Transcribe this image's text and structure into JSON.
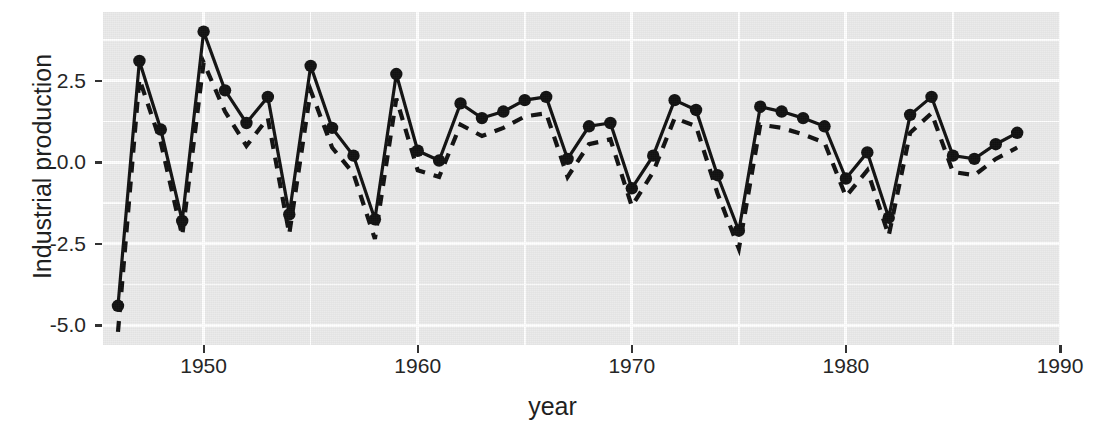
{
  "chart_data": {
    "type": "line",
    "title": "",
    "xlabel": "year",
    "ylabel": "Industrial production",
    "xlim": [
      1945.3,
      1990.0
    ],
    "ylim": [
      -5.6,
      4.6
    ],
    "xticks": [
      1950,
      1960,
      1970,
      1980,
      1990
    ],
    "xticklabels": [
      "1950",
      "1960",
      "1970",
      "1980",
      "1990"
    ],
    "yticks": [
      2.5,
      0.0,
      -2.5,
      -5.0
    ],
    "yticklabels": [
      "2.5",
      "0.0",
      "-2.5",
      "-5.0"
    ],
    "grid": true,
    "legend": "none",
    "panel_background": "#ebebeb",
    "grid_color": "#ffffff",
    "line_color": "#000000",
    "x": [
      1946,
      1947,
      1948,
      1949,
      1950,
      1951,
      1952,
      1953,
      1954,
      1955,
      1956,
      1957,
      1958,
      1959,
      1960,
      1961,
      1962,
      1963,
      1964,
      1965,
      1966,
      1967,
      1968,
      1969,
      1970,
      1971,
      1972,
      1973,
      1974,
      1975,
      1976,
      1977,
      1978,
      1979,
      1980,
      1981,
      1982,
      1983,
      1984,
      1985,
      1986,
      1987,
      1988
    ],
    "series": [
      {
        "name": "observed",
        "style": "solid-with-points",
        "marker": "filled-circle",
        "values": [
          -4.4,
          3.1,
          1.0,
          -1.8,
          4.0,
          2.2,
          1.2,
          2.0,
          -1.6,
          2.95,
          1.05,
          0.2,
          -1.75,
          2.7,
          0.35,
          0.05,
          1.8,
          1.35,
          1.55,
          1.9,
          2.0,
          0.1,
          1.1,
          1.2,
          -0.8,
          0.2,
          1.9,
          1.6,
          -0.4,
          -2.1,
          1.7,
          1.55,
          1.35,
          1.1,
          -0.5,
          0.3,
          -1.7,
          1.45,
          2.0,
          0.2,
          0.1,
          0.55,
          0.9
        ]
      },
      {
        "name": "fitted",
        "style": "dashed",
        "marker": "none",
        "values": [
          -5.2,
          2.55,
          0.6,
          -2.25,
          3.05,
          1.55,
          0.5,
          1.35,
          -2.2,
          2.2,
          0.45,
          -0.35,
          -2.35,
          1.95,
          -0.25,
          -0.45,
          1.15,
          0.8,
          1.05,
          1.4,
          1.5,
          -0.45,
          0.55,
          0.7,
          -1.35,
          -0.3,
          1.35,
          1.1,
          -0.95,
          -2.65,
          1.15,
          1.05,
          0.85,
          0.6,
          -1.05,
          -0.25,
          -2.25,
          0.9,
          1.5,
          -0.3,
          -0.4,
          0.1,
          0.45
        ]
      }
    ]
  },
  "axis": {
    "y_title": "Industrial production",
    "x_title": "year"
  }
}
